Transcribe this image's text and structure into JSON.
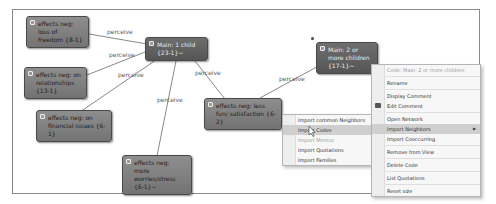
{
  "canvas": {
    "nodes": [
      {
        "id": "n1",
        "label": "effects neg: loss of freedom {8-1}",
        "style": "light",
        "x": 26,
        "y": 16,
        "w": 63,
        "h": 25
      },
      {
        "id": "n2",
        "label": "Main: 1 child {23-1}~",
        "style": "dark",
        "x": 145,
        "y": 37,
        "w": 63,
        "h": 14
      },
      {
        "id": "n3",
        "label": "effects neg: on relationships {13-1}",
        "style": "light",
        "x": 24,
        "y": 67,
        "w": 63,
        "h": 22
      },
      {
        "id": "n4",
        "label": "effects neg: on financial issues {6-1}",
        "style": "light",
        "x": 36,
        "y": 110,
        "w": 76,
        "h": 22
      },
      {
        "id": "n5",
        "label": "effects neg: less fun/ satisfaction {6-2}",
        "style": "light",
        "x": 204,
        "y": 98,
        "w": 78,
        "h": 22
      },
      {
        "id": "n6",
        "label": "Main: 2 or more children {17-1}~",
        "style": "dark",
        "x": 316,
        "y": 42,
        "w": 62,
        "h": 22
      },
      {
        "id": "n7",
        "label": "effects neg: more worries/stress {6-1}~",
        "style": "light",
        "x": 122,
        "y": 155,
        "w": 70,
        "h": 22
      }
    ],
    "edges": [
      {
        "label": "perceive",
        "x1": 89,
        "y1": 34,
        "x2": 147,
        "y2": 44,
        "lx": 107,
        "ly": 28
      },
      {
        "label": "perceive",
        "x1": 87,
        "y1": 75,
        "x2": 150,
        "y2": 50,
        "lx": 109,
        "ly": 51
      },
      {
        "label": "perceive",
        "x1": 80,
        "y1": 112,
        "x2": 169,
        "y2": 51,
        "lx": 118,
        "ly": 71
      },
      {
        "label": "perceive",
        "x1": 157,
        "y1": 156,
        "x2": 178,
        "y2": 51,
        "lx": 157,
        "ly": 96
      },
      {
        "label": "perceive",
        "x1": 225,
        "y1": 99,
        "x2": 187,
        "y2": 51,
        "lx": 195,
        "ly": 69
      },
      {
        "label": "perceive",
        "x1": 260,
        "y1": 98,
        "x2": 322,
        "y2": 64,
        "lx": 279,
        "ly": 75
      }
    ],
    "selection_marker": {
      "x": 311,
      "y": 37
    }
  },
  "context_menu": {
    "items": [
      {
        "label": "Code: Main: 2 or more  children",
        "disabled": true
      },
      {
        "sep": true
      },
      {
        "label": "Rename"
      },
      {
        "sep": true
      },
      {
        "label": "Display Comment"
      },
      {
        "label": "Edit Comment",
        "icon": "comment-icon"
      },
      {
        "sep": true
      },
      {
        "label": "Open Network"
      },
      {
        "label": "Import Neighbors",
        "highlight": true,
        "submenu": true
      },
      {
        "label": "Import Cooccurring"
      },
      {
        "sep": true
      },
      {
        "label": "Remove from View"
      },
      {
        "sep": true
      },
      {
        "label": "Delete Code"
      },
      {
        "sep": true
      },
      {
        "label": "List Quotations"
      },
      {
        "sep": true
      },
      {
        "label": "Reset size"
      }
    ]
  },
  "submenu": {
    "items": [
      {
        "label": "Import common Neighbors"
      },
      {
        "label": "Import Codes",
        "highlight": true
      },
      {
        "label": "Import Memos",
        "disabled": true
      },
      {
        "label": "Import Quotations"
      },
      {
        "label": "Import Families"
      }
    ]
  },
  "colors": {
    "node_light": "#808080",
    "node_dark": "#5f5f5f",
    "edge": "#6a6a6a",
    "menu_bg": "#f7f7f7",
    "menu_highlight": "#cfcfcf"
  }
}
